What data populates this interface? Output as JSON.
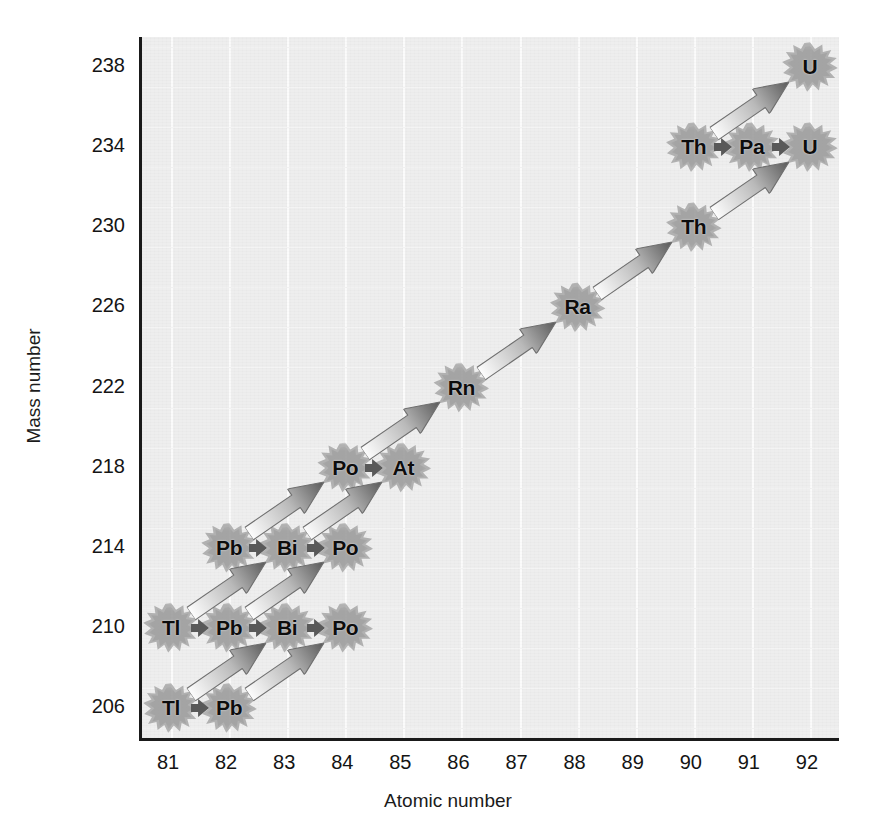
{
  "chart_data": {
    "type": "scatter",
    "title": "",
    "xlabel": "Atomic number",
    "ylabel": "Mass number",
    "xlim": [
      80.5,
      92.5
    ],
    "ylim": [
      204.5,
      239.5
    ],
    "xticks": [
      81,
      82,
      83,
      84,
      85,
      86,
      87,
      88,
      89,
      90,
      91,
      92
    ],
    "yticks": [
      206,
      210,
      214,
      218,
      222,
      226,
      230,
      234,
      238
    ],
    "grid": true,
    "legend": "none",
    "nuclides": [
      {
        "symbol": "U",
        "z": 92,
        "a": 238
      },
      {
        "symbol": "Th",
        "z": 90,
        "a": 234
      },
      {
        "symbol": "Pa",
        "z": 91,
        "a": 234
      },
      {
        "symbol": "U",
        "z": 92,
        "a": 234
      },
      {
        "symbol": "Th",
        "z": 90,
        "a": 230
      },
      {
        "symbol": "Ra",
        "z": 88,
        "a": 226
      },
      {
        "symbol": "Rn",
        "z": 86,
        "a": 222
      },
      {
        "symbol": "Po",
        "z": 84,
        "a": 218
      },
      {
        "symbol": "At",
        "z": 85,
        "a": 218
      },
      {
        "symbol": "Pb",
        "z": 82,
        "a": 214
      },
      {
        "symbol": "Bi",
        "z": 83,
        "a": 214
      },
      {
        "symbol": "Po",
        "z": 84,
        "a": 214
      },
      {
        "symbol": "Tl",
        "z": 81,
        "a": 210
      },
      {
        "symbol": "Pb",
        "z": 82,
        "a": 210
      },
      {
        "symbol": "Bi",
        "z": 83,
        "a": 210
      },
      {
        "symbol": "Po",
        "z": 84,
        "a": 210
      },
      {
        "symbol": "Tl",
        "z": 81,
        "a": 206
      },
      {
        "symbol": "Pb",
        "z": 82,
        "a": 206
      }
    ],
    "decays": [
      {
        "type": "alpha",
        "from": {
          "z": 92,
          "a": 238
        },
        "to": {
          "z": 90,
          "a": 234
        }
      },
      {
        "type": "beta",
        "from": {
          "z": 90,
          "a": 234
        },
        "to": {
          "z": 91,
          "a": 234
        }
      },
      {
        "type": "beta",
        "from": {
          "z": 91,
          "a": 234
        },
        "to": {
          "z": 92,
          "a": 234
        }
      },
      {
        "type": "alpha",
        "from": {
          "z": 92,
          "a": 234
        },
        "to": {
          "z": 90,
          "a": 230
        }
      },
      {
        "type": "alpha",
        "from": {
          "z": 90,
          "a": 230
        },
        "to": {
          "z": 88,
          "a": 226
        }
      },
      {
        "type": "alpha",
        "from": {
          "z": 88,
          "a": 226
        },
        "to": {
          "z": 86,
          "a": 222
        }
      },
      {
        "type": "alpha",
        "from": {
          "z": 86,
          "a": 222
        },
        "to": {
          "z": 84,
          "a": 218
        }
      },
      {
        "type": "beta",
        "from": {
          "z": 84,
          "a": 218
        },
        "to": {
          "z": 85,
          "a": 218
        }
      },
      {
        "type": "alpha",
        "from": {
          "z": 84,
          "a": 218
        },
        "to": {
          "z": 82,
          "a": 214
        }
      },
      {
        "type": "alpha",
        "from": {
          "z": 85,
          "a": 218
        },
        "to": {
          "z": 83,
          "a": 214
        }
      },
      {
        "type": "beta",
        "from": {
          "z": 82,
          "a": 214
        },
        "to": {
          "z": 83,
          "a": 214
        }
      },
      {
        "type": "beta",
        "from": {
          "z": 83,
          "a": 214
        },
        "to": {
          "z": 84,
          "a": 214
        }
      },
      {
        "type": "alpha",
        "from": {
          "z": 83,
          "a": 214
        },
        "to": {
          "z": 81,
          "a": 210
        }
      },
      {
        "type": "alpha",
        "from": {
          "z": 84,
          "a": 214
        },
        "to": {
          "z": 82,
          "a": 210
        }
      },
      {
        "type": "beta",
        "from": {
          "z": 81,
          "a": 210
        },
        "to": {
          "z": 82,
          "a": 210
        }
      },
      {
        "type": "beta",
        "from": {
          "z": 82,
          "a": 210
        },
        "to": {
          "z": 83,
          "a": 210
        }
      },
      {
        "type": "beta",
        "from": {
          "z": 83,
          "a": 210
        },
        "to": {
          "z": 84,
          "a": 210
        }
      },
      {
        "type": "alpha",
        "from": {
          "z": 83,
          "a": 210
        },
        "to": {
          "z": 81,
          "a": 206
        }
      },
      {
        "type": "alpha",
        "from": {
          "z": 84,
          "a": 210
        },
        "to": {
          "z": 82,
          "a": 206
        }
      },
      {
        "type": "beta",
        "from": {
          "z": 81,
          "a": 206
        },
        "to": {
          "z": 82,
          "a": 206
        }
      }
    ]
  },
  "colors": {
    "plot_background": "#eeeeee",
    "gridline": "#fbfbfb",
    "axis": "#1a1a1a",
    "label_text": "#141414",
    "nuclide_text": "#0d0d0d",
    "burst": "#9a9a9a",
    "arrow_dark": "#595959",
    "arrow_light": "#fdfdfd"
  }
}
